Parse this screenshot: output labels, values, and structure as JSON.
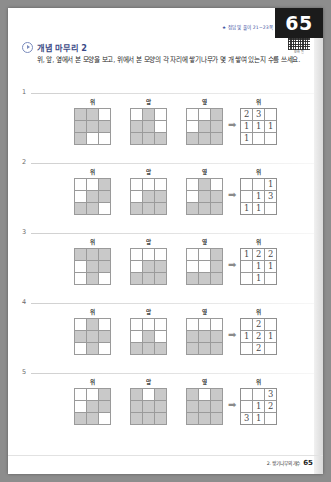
{
  "page": {
    "number": "65",
    "reference_note": "★ 정답 및 풀이 21~23쪽",
    "qr_caption": "모바일",
    "footer_note": "2. 쌓기나무의 개수",
    "footer_page": "65"
  },
  "header": {
    "section_title": "개념 마무리 2",
    "instruction": "위, 앞, 옆에서 본 모양을 보고, 위에서 본 모양의 각 자리에 쌓기나무가 몇 개 쌓여 있는지 수를 쓰세요."
  },
  "labels": {
    "top": "위",
    "front": "앞",
    "side": "옆",
    "arrow": "➡"
  },
  "problems": [
    {
      "number": "1",
      "views": {
        "top": [
          [
            1,
            1,
            0
          ],
          [
            1,
            1,
            1
          ],
          [
            1,
            0,
            0
          ]
        ],
        "front": [
          [
            0,
            1,
            0
          ],
          [
            1,
            1,
            0
          ],
          [
            1,
            1,
            1
          ]
        ],
        "side": [
          [
            0,
            0,
            1
          ],
          [
            0,
            1,
            1
          ],
          [
            1,
            1,
            1
          ]
        ]
      },
      "answer": {
        "label": "위",
        "cells": [
          [
            "2",
            "3",
            ""
          ],
          [
            "1",
            "1",
            "1"
          ],
          [
            "1",
            "",
            ""
          ]
        ],
        "filled": [
          [
            1,
            1,
            0
          ],
          [
            1,
            1,
            1
          ],
          [
            1,
            0,
            0
          ]
        ]
      }
    },
    {
      "number": "2",
      "views": {
        "top": [
          [
            0,
            0,
            1
          ],
          [
            0,
            1,
            1
          ],
          [
            1,
            1,
            0
          ]
        ],
        "front": [
          [
            0,
            0,
            0
          ],
          [
            0,
            1,
            1
          ],
          [
            1,
            1,
            1
          ]
        ],
        "side": [
          [
            0,
            1,
            0
          ],
          [
            0,
            1,
            1
          ],
          [
            1,
            1,
            1
          ]
        ]
      },
      "answer": {
        "label": "위",
        "cells": [
          [
            "",
            "",
            "1"
          ],
          [
            "",
            "1",
            "3"
          ],
          [
            "1",
            "1",
            ""
          ]
        ],
        "filled": [
          [
            0,
            0,
            1
          ],
          [
            0,
            1,
            1
          ],
          [
            1,
            1,
            0
          ]
        ]
      }
    },
    {
      "number": "3",
      "views": {
        "top": [
          [
            1,
            1,
            1
          ],
          [
            0,
            1,
            1
          ],
          [
            0,
            1,
            0
          ]
        ],
        "front": [
          [
            0,
            0,
            0
          ],
          [
            0,
            1,
            1
          ],
          [
            1,
            1,
            1
          ]
        ],
        "side": [
          [
            0,
            0,
            1
          ],
          [
            0,
            0,
            1
          ],
          [
            1,
            1,
            1
          ]
        ]
      },
      "answer": {
        "label": "위",
        "cells": [
          [
            "1",
            "2",
            "2"
          ],
          [
            "",
            "1",
            "1"
          ],
          [
            "",
            "1",
            ""
          ]
        ],
        "filled": [
          [
            1,
            1,
            1
          ],
          [
            0,
            1,
            1
          ],
          [
            0,
            1,
            0
          ]
        ]
      }
    },
    {
      "number": "4",
      "views": {
        "top": [
          [
            0,
            1,
            0
          ],
          [
            1,
            1,
            1
          ],
          [
            0,
            1,
            0
          ]
        ],
        "front": [
          [
            0,
            0,
            0
          ],
          [
            0,
            1,
            0
          ],
          [
            1,
            1,
            1
          ]
        ],
        "side": [
          [
            0,
            0,
            0
          ],
          [
            1,
            1,
            1
          ],
          [
            1,
            1,
            1
          ]
        ]
      },
      "answer": {
        "label": "위",
        "cells": [
          [
            "",
            "2",
            ""
          ],
          [
            "1",
            "2",
            "1"
          ],
          [
            "",
            "2",
            ""
          ]
        ],
        "filled": [
          [
            0,
            1,
            0
          ],
          [
            1,
            1,
            1
          ],
          [
            0,
            1,
            0
          ]
        ]
      }
    },
    {
      "number": "5",
      "views": {
        "top": [
          [
            0,
            0,
            1
          ],
          [
            0,
            1,
            1
          ],
          [
            1,
            1,
            0
          ]
        ],
        "front": [
          [
            1,
            0,
            1
          ],
          [
            1,
            1,
            1
          ],
          [
            1,
            1,
            1
          ]
        ],
        "side": [
          [
            1,
            0,
            1
          ],
          [
            1,
            1,
            1
          ],
          [
            1,
            1,
            1
          ]
        ]
      },
      "answer": {
        "label": "위",
        "cells": [
          [
            "",
            "",
            "3"
          ],
          [
            "",
            "1",
            "2"
          ],
          [
            "3",
            "1",
            ""
          ]
        ],
        "filled": [
          [
            0,
            0,
            1
          ],
          [
            0,
            1,
            1
          ],
          [
            1,
            1,
            0
          ]
        ]
      }
    }
  ],
  "colors": {
    "accent_title": "#3b4a86",
    "cell_fill": "#c9c9c9",
    "grid_line": "#9a9a9a",
    "badge_bg": "#1b1b1b",
    "ref_note": "#3a4fa0"
  }
}
